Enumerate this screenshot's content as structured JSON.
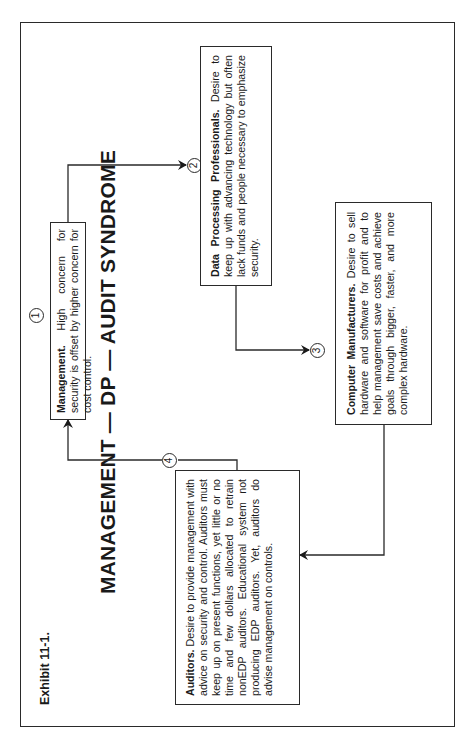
{
  "exhibit_label": "Exhibit 11-1.",
  "title": "MANAGEMENT — DP — AUDIT SYNDROME",
  "nodes": [
    {
      "number": "1",
      "heading": "Management.",
      "text": "High concern for security is offset by higher concern for cost control."
    },
    {
      "number": "2",
      "heading": "Data Processing Professionals.",
      "text": "Desire to keep up with advancing technology but often lack funds and people necessary to emphasize security."
    },
    {
      "number": "3",
      "heading": "Computer Manufacturers.",
      "text": "Desire to sell hardware and software for profit and to help management save costs and achieve goals through bigger, faster, and more complex hardware."
    },
    {
      "number": "4",
      "heading": "Auditors.",
      "text": "Desire to provide management with advice on security and control. Auditors must keep up on present functions, yet little or no time and few dollars allocated to retrain nonEDP auditors. Educational system not producing EDP auditors. Yet, auditors do advise management on controls."
    }
  ],
  "flow": [
    "Management → Data Processing Professionals",
    "Data Processing Professionals → Computer Manufacturers",
    "Computer Manufacturers → Auditors",
    "Auditors → Management"
  ],
  "colors": {
    "line": "#2a2a2a",
    "background": "#ffffff"
  }
}
